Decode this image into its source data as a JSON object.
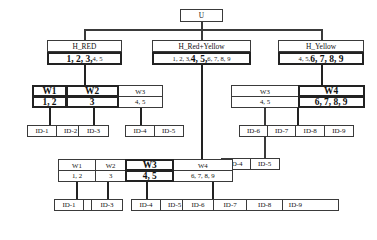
{
  "diagram": {
    "root": {
      "label": "U"
    },
    "level1": [
      {
        "name": "node-h-red",
        "title": "H_RED",
        "highlight": "1, 2, 3,",
        "rest": " 4, 5"
      },
      {
        "name": "node-h-red-yellow",
        "title": "H_Red+Yellow",
        "prefix": "1, 2, 3, ",
        "highlight": "4, 5,",
        "rest": " 6, 7, 8, 9"
      },
      {
        "name": "node-h-yellow",
        "title": "H_Yellow",
        "prefix": "4, 5, ",
        "highlight": "6, 7, 8, 9",
        "rest": ""
      }
    ],
    "wtable_left": {
      "name": "wtable-red",
      "headers": [
        {
          "label": "W1",
          "emph": true
        },
        {
          "label": "W2",
          "emph": true
        },
        {
          "label": "W3",
          "emph": false
        }
      ],
      "values": [
        {
          "label": "1, 2",
          "emph": true
        },
        {
          "label": "3",
          "emph": true
        },
        {
          "label": "4, 5",
          "emph": false
        }
      ]
    },
    "wtable_right": {
      "name": "wtable-yellow",
      "headers": [
        {
          "label": "W3",
          "emph": false
        },
        {
          "label": "W4",
          "emph": true
        }
      ],
      "values": [
        {
          "label": "4, 5",
          "emph": false
        },
        {
          "label": "6, 7, 8, 9",
          "emph": true
        }
      ]
    },
    "wtable_bottom": {
      "name": "wtable-red-yellow",
      "headers": [
        {
          "label": "W1",
          "emph": false
        },
        {
          "label": "W2",
          "emph": false
        },
        {
          "label": "W3",
          "emph": true
        },
        {
          "label": "W4",
          "emph": false
        }
      ],
      "values": [
        {
          "label": "1, 2",
          "emph": false
        },
        {
          "label": "3",
          "emph": false
        },
        {
          "label": "4, 5",
          "emph": true
        },
        {
          "label": "6, 7, 8, 9",
          "emph": false
        }
      ]
    },
    "ids_row_upper_left": [
      {
        "label": "ID-1"
      },
      {
        "label": "ID-2"
      }
    ],
    "ids_row_upper_mid": [
      {
        "label": "ID-3"
      }
    ],
    "ids_row_upper_right": [
      {
        "label": "ID-4"
      },
      {
        "label": "ID-5"
      }
    ],
    "ids_row_yellow": [
      {
        "label": "ID-6"
      },
      {
        "label": "ID-7"
      },
      {
        "label": "ID-8"
      },
      {
        "label": "ID-9"
      }
    ],
    "ids_row_mid_w3": [
      {
        "label": "ID-4"
      },
      {
        "label": "ID-5"
      }
    ],
    "ids_row_bottom_left": [
      {
        "label": "ID-1"
      },
      {
        "label": "ID-2"
      }
    ],
    "ids_row_bottom_mid": [
      {
        "label": "ID-3"
      }
    ],
    "ids_row_bottom_w3": [
      {
        "label": "ID-4"
      },
      {
        "label": "ID-5"
      }
    ],
    "ids_row_bottom_w4": [
      {
        "label": "ID-6"
      },
      {
        "label": "ID-7"
      },
      {
        "label": "ID-8"
      },
      {
        "label": "ID-9"
      }
    ],
    "colors": {
      "line": "#3a3a3a",
      "emphasis_border": "#222222",
      "background": "#ffffff",
      "text": "#111111"
    }
  }
}
